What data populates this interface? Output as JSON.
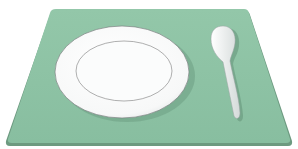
{
  "scene": {
    "description": "Illustration of a table setting: green placemat with a white plate and a spoon",
    "objects": [
      "placemat",
      "plate",
      "spoon"
    ]
  },
  "colors": {
    "background": "#ffffff",
    "placemat": "#8fc4a6",
    "placemat_edge": "#5e8d73",
    "plate": "#ffffff",
    "plate_outline": "#6f6f6f",
    "spoon": "#f4f6f6"
  }
}
